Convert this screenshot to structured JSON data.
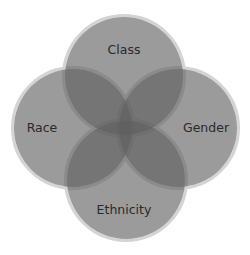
{
  "diagram": {
    "type": "venn",
    "circles": [
      {
        "id": "class",
        "label": "Class",
        "cx": 124,
        "cy": 76,
        "r": 59
      },
      {
        "id": "race",
        "label": "Race",
        "cx": 73,
        "cy": 128,
        "r": 59
      },
      {
        "id": "gender",
        "label": "Gender",
        "cx": 178,
        "cy": 128,
        "r": 59
      },
      {
        "id": "ethnicity",
        "label": "Ethnicity",
        "cx": 126,
        "cy": 180,
        "r": 59
      }
    ],
    "fill_color": "#5e5e5e",
    "fill_opacity": 0.62,
    "stroke_color": "#d4d4d4"
  }
}
